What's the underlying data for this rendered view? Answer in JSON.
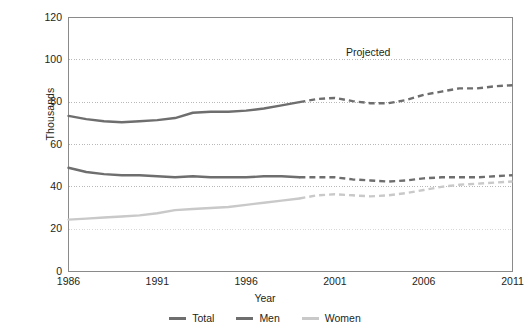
{
  "chart_data": {
    "type": "line",
    "title": "",
    "xlabel": "Year",
    "ylabel": "Thousands",
    "xlim": [
      1986,
      2011
    ],
    "ylim": [
      0,
      120
    ],
    "ytick_labels": [
      "0",
      "20",
      "40",
      "60",
      "80",
      "100",
      "120"
    ],
    "ytick_values": [
      0,
      20,
      40,
      60,
      80,
      100,
      120
    ],
    "xtick_labels": [
      "1986",
      "1991",
      "1996",
      "2001",
      "2006",
      "2011"
    ],
    "xtick_values": [
      1986,
      1991,
      1996,
      2001,
      2006,
      2011
    ],
    "grid": "horizontal-dotted",
    "legend_position": "bottom-center",
    "annotations": [
      {
        "text": "Projected",
        "x": 2003.2,
        "y": 103
      }
    ],
    "projection_starts_at": 1999,
    "x": [
      1986,
      1987,
      1988,
      1989,
      1990,
      1991,
      1992,
      1993,
      1994,
      1995,
      1996,
      1997,
      1998,
      1999,
      2000,
      2001,
      2002,
      2003,
      2004,
      2005,
      2006,
      2007,
      2008,
      2009,
      2010,
      2011
    ],
    "series": [
      {
        "name": "Total",
        "color": "#6e6e6e",
        "values": [
          73.5,
          72.0,
          71.0,
          70.5,
          71.0,
          71.5,
          72.5,
          75.0,
          75.5,
          75.5,
          76.0,
          77.0,
          78.5,
          80.0,
          81.5,
          82.0,
          80.5,
          79.5,
          79.5,
          81.0,
          83.5,
          85.0,
          86.5,
          86.5,
          87.5,
          88.0
        ]
      },
      {
        "name": "Men",
        "color": "#6e6e6e",
        "values": [
          49.0,
          47.0,
          46.0,
          45.5,
          45.5,
          45.0,
          44.5,
          45.0,
          44.5,
          44.5,
          44.5,
          45.0,
          45.0,
          44.5,
          44.5,
          44.5,
          43.5,
          43.0,
          42.5,
          43.0,
          44.0,
          44.5,
          44.5,
          44.5,
          45.0,
          45.5
        ]
      },
      {
        "name": "Women",
        "color": "#c9c9c9",
        "values": [
          24.5,
          25.0,
          25.5,
          26.0,
          26.5,
          27.5,
          29.0,
          29.5,
          30.0,
          30.5,
          31.5,
          32.5,
          33.5,
          34.5,
          36.0,
          36.5,
          36.0,
          35.5,
          36.0,
          37.0,
          38.5,
          40.0,
          41.0,
          41.5,
          42.0,
          42.5
        ]
      }
    ],
    "legend": [
      {
        "label": "Total",
        "color": "#6e6e6e"
      },
      {
        "label": "Men",
        "color": "#6e6e6e"
      },
      {
        "label": "Women",
        "color": "#c9c9c9"
      }
    ]
  },
  "axis": {
    "ylabel": "Thousands",
    "xlabel": "Year"
  },
  "annotation": {
    "projected": "Projected"
  }
}
